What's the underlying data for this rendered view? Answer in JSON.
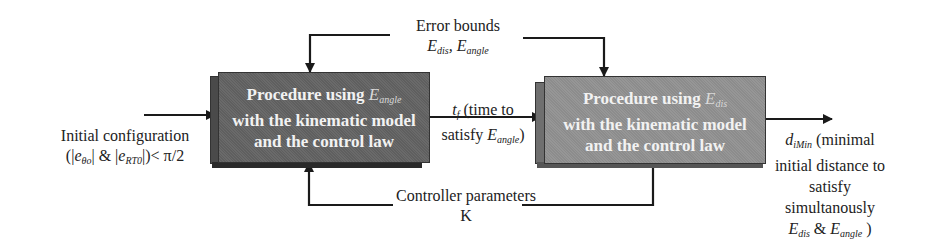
{
  "diagram": {
    "type": "block-diagram",
    "blocks": [
      {
        "id": "angle-procedure",
        "line1": "Procedure using ",
        "var_main": "E",
        "var_sub": "angle",
        "line2": "with the kinematic model",
        "line3": "and the control law",
        "fill": "#656565"
      },
      {
        "id": "dis-procedure",
        "line1": "Procedure using ",
        "var_main": "E",
        "var_sub": "dis",
        "line2": "with the kinematic model",
        "line3": "and the control law",
        "fill": "#919191"
      }
    ],
    "labels": {
      "error_bounds": {
        "title": "Error bounds",
        "e1_main": "E",
        "e1_sub": "dis",
        "sep": ", ",
        "e2_main": "E",
        "e2_sub": "angle"
      },
      "controller": {
        "title": "Controller parameters",
        "symbol": "K"
      },
      "input": {
        "line1": "Initial configuration",
        "line2_prefix": "(|",
        "e1_main": "e",
        "e1_sub": "θo",
        "mid": "| & |",
        "e2_main": "e",
        "e2_sub": "RT0",
        "line2_suffix": "|)< π/2"
      },
      "intermediate": {
        "var_main": "t",
        "var_sub": "f",
        "line1_rest": " (time to",
        "line2_prefix": "satisfy ",
        "e_main": "E",
        "e_sub": "angle",
        "line2_suffix": ")"
      },
      "output": {
        "var_main": "d",
        "var_sub": "iMin",
        "line1_rest": " (minimal",
        "line2": "initial distance to",
        "line3": "satisfy",
        "line4": "simultanously",
        "e1_main": "E",
        "e1_sub": "dis",
        "amp": " & ",
        "e2_main": "E",
        "e2_sub": "angle",
        "close": " )"
      }
    },
    "colors": {
      "line": "#1a1a1a",
      "block1": "#656565",
      "block2": "#919191",
      "text_on_block": "#f2f2f2"
    }
  }
}
